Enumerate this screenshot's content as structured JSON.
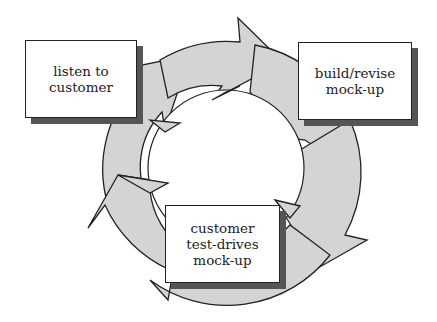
{
  "diagram": {
    "type": "cycle",
    "colors": {
      "ring": "#d4d4d4",
      "stroke": "#222222",
      "shadow": "#555555",
      "box": "#ffffff"
    },
    "steps": [
      {
        "lines": [
          "listen to",
          "customer"
        ]
      },
      {
        "lines": [
          "build/revise",
          "mock-up"
        ]
      },
      {
        "lines": [
          "customer",
          "test-drives",
          "mock-up"
        ]
      }
    ]
  }
}
